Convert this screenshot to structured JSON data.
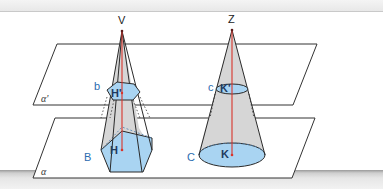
{
  "figure": {
    "type": "geometry-diagram",
    "planes": [
      {
        "id": "upper-plane",
        "label": "α'"
      },
      {
        "id": "lower-plane",
        "label": "α"
      }
    ],
    "pyramid": {
      "apex_label": "V",
      "base_label": "B",
      "base_foot_label": "H",
      "section_label": "b",
      "section_foot_label": "H'"
    },
    "cone": {
      "apex_label": "Z",
      "base_label": "C",
      "base_foot_label": "K",
      "section_label": "c",
      "section_foot_label": "K'"
    },
    "colors": {
      "section_fill": "#a9d4f2",
      "lateral_fill": "#d9d9d9",
      "height_line": "#d9342b",
      "edge": "#2a2a2a",
      "label_blue": "#2b6cb0"
    }
  }
}
